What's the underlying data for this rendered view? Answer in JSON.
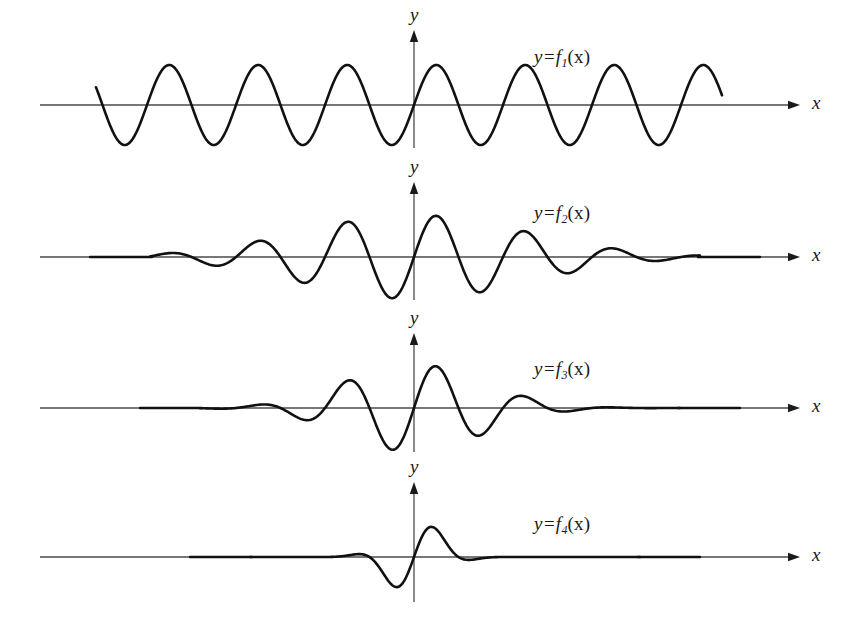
{
  "figure": {
    "background_color": "#ffffff",
    "ink_color": "#1a1a1a",
    "axis_color": "#4a4a4a",
    "curve_color": "#111111",
    "width": 854,
    "height": 641
  },
  "axis_labels": {
    "x": "x",
    "y": "y"
  },
  "panels": [
    {
      "id": "panel-1",
      "label_prefix": "y=f",
      "label_sub": "1",
      "label_suffix": "(x)",
      "label_text": "y=f1(x)",
      "label_x": 534,
      "label_y": 46,
      "baseline_y": 105,
      "axis_x0": 40,
      "axis_x1": 800,
      "y_axis_x": 414,
      "y_axis_top": 30,
      "y_axis_bottom": 148,
      "curve_x_start": 96,
      "curve_x_end": 722,
      "amplitude": 40,
      "wavelength": 89,
      "envelope": "uniform",
      "envelope_sigma": 0,
      "description": "uniform amplitude sine wave, many oscillations"
    },
    {
      "id": "panel-2",
      "label_prefix": "y=f",
      "label_sub": "2",
      "label_suffix": "(x)",
      "label_text": "y=f2(x)",
      "label_x": 534,
      "label_y": 202,
      "baseline_y": 257,
      "axis_x0": 40,
      "axis_x1": 800,
      "y_axis_x": 414,
      "y_axis_top": 182,
      "y_axis_bottom": 300,
      "curve_x_start": 150,
      "curve_x_end": 700,
      "amplitude": 42,
      "wavelength": 89,
      "envelope": "gaussian",
      "envelope_sigma": 112,
      "description": "gaussian-modulated wave packet, moderate width"
    },
    {
      "id": "panel-3",
      "label_prefix": "y=f",
      "label_sub": "3",
      "label_suffix": "(x)",
      "label_text": "y=f3(x)",
      "label_x": 534,
      "label_y": 358,
      "baseline_y": 408,
      "axis_x0": 40,
      "axis_x1": 800,
      "y_axis_x": 414,
      "y_axis_top": 333,
      "y_axis_bottom": 452,
      "curve_x_start": 200,
      "curve_x_end": 680,
      "amplitude": 44,
      "wavelength": 89,
      "envelope": "gaussian",
      "envelope_sigma": 68,
      "description": "gaussian-modulated wave packet, narrower"
    },
    {
      "id": "panel-4",
      "label_prefix": "y=f",
      "label_sub": "4",
      "label_suffix": "(x)",
      "label_text": "y=f4(x)",
      "label_x": 534,
      "label_y": 513,
      "baseline_y": 557,
      "axis_x0": 40,
      "axis_x1": 800,
      "y_axis_x": 414,
      "y_axis_top": 482,
      "y_axis_bottom": 602,
      "curve_x_start": 250,
      "curve_x_end": 640,
      "amplitude": 40,
      "wavelength": 89,
      "envelope": "gaussian",
      "envelope_sigma": 26,
      "description": "single narrow pulse, nearly one oscillation"
    }
  ],
  "chart_data": {
    "type": "line",
    "title": "",
    "xlabel": "x",
    "ylabel": "y",
    "grid": false,
    "legend": "inline-annotations",
    "series": [
      {
        "name": "y=f1(x)",
        "form": "A*sin(k*x)",
        "amplitude": 1.0,
        "envelope": "none",
        "cycles_visible": 7,
        "annotation": "y=f1(x)"
      },
      {
        "name": "y=f2(x)",
        "form": "A*exp(-x^2/(2*s^2))*sin(k*x)",
        "amplitude": 1.0,
        "envelope": "gaussian",
        "envelope_width_px": 112,
        "cycles_visible": 5,
        "annotation": "y=f2(x)"
      },
      {
        "name": "y=f3(x)",
        "form": "A*exp(-x^2/(2*s^2))*sin(k*x)",
        "amplitude": 1.05,
        "envelope": "gaussian",
        "envelope_width_px": 68,
        "cycles_visible": 3,
        "annotation": "y=f3(x)"
      },
      {
        "name": "y=f4(x)",
        "form": "A*exp(-x^2/(2*s^2))*sin(k*x)",
        "amplitude": 0.95,
        "envelope": "gaussian",
        "envelope_width_px": 26,
        "cycles_visible": 1,
        "annotation": "y=f4(x)"
      }
    ]
  }
}
